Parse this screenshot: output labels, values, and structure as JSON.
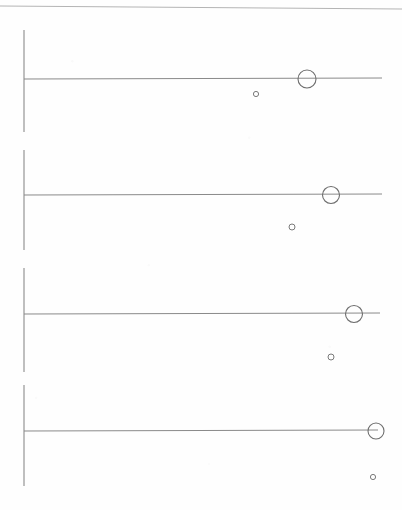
{
  "document": {
    "kind": "scanned-figure-sheet",
    "width": 402,
    "height": 510,
    "background_color": "#fefefe",
    "ink_color": "#8a8a8a",
    "ink_color_dark": "#6e6e6e",
    "top_rule": {
      "name": "page-top-rule",
      "x1": 0,
      "y1": 6,
      "x2": 402,
      "y2": 9,
      "color": "#b4b4b4",
      "width": 1
    }
  },
  "chart_data": {
    "type": "scatter",
    "title": "",
    "subtitle": "",
    "xlabel": "",
    "ylabel": "",
    "grid": false,
    "legend": false,
    "panel_count": 4,
    "series": [
      {
        "name": "large-open-circle",
        "marker": "open-circle",
        "marker_size": "large",
        "values": [
          {
            "panel": 1,
            "x": 307,
            "y": 79,
            "r": 9.0
          },
          {
            "panel": 2,
            "x": 331,
            "y": 195,
            "r": 8.5
          },
          {
            "panel": 3,
            "x": 354,
            "y": 314,
            "r": 8.5
          },
          {
            "panel": 4,
            "x": 376,
            "y": 431,
            "r": 8.0
          }
        ]
      },
      {
        "name": "small-open-circle",
        "marker": "open-circle",
        "marker_size": "small",
        "values": [
          {
            "panel": 1,
            "x": 256,
            "y": 94,
            "r": 2.6
          },
          {
            "panel": 2,
            "x": 292,
            "y": 227,
            "r": 3.0
          },
          {
            "panel": 3,
            "x": 331,
            "y": 357,
            "r": 3.0
          },
          {
            "panel": 4,
            "x": 373,
            "y": 477,
            "r": 2.6
          }
        ]
      }
    ],
    "panels": [
      {
        "index": 1,
        "name": "panel-1",
        "baseline": {
          "x1": 24,
          "y": 79,
          "x2": 382
        },
        "axis": {
          "x": 24,
          "y1": 30,
          "y2": 132
        }
      },
      {
        "index": 2,
        "name": "panel-2",
        "baseline": {
          "x1": 24,
          "y": 195,
          "x2": 382
        },
        "axis": {
          "x": 24,
          "y1": 150,
          "y2": 250
        }
      },
      {
        "index": 3,
        "name": "panel-3",
        "baseline": {
          "x1": 24,
          "y": 314,
          "x2": 380
        },
        "axis": {
          "x": 24,
          "y1": 268,
          "y2": 372
        }
      },
      {
        "index": 4,
        "name": "panel-4",
        "baseline": {
          "x1": 24,
          "y": 431,
          "x2": 378
        },
        "axis": {
          "x": 24,
          "y1": 385,
          "y2": 486
        }
      }
    ]
  }
}
